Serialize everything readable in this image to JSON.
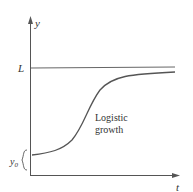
{
  "diagram": {
    "y_axis_label": "y",
    "x_axis_label": "t",
    "limit_label": "L",
    "initial_label": "y0",
    "curve_label_line1": "Logistic",
    "curve_label_line2": "growth",
    "colors": {
      "axis": "#555555",
      "curve": "#555555",
      "limit_line": "#666666",
      "text": "#333333"
    }
  }
}
